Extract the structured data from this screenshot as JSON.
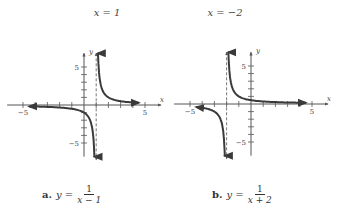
{
  "chart_data": [
    {
      "type": "line",
      "label": "a.",
      "equation": "y = 1/(x - 1)",
      "equation_lhs": "y =",
      "numerator": "1",
      "denominator": "x − 1",
      "asymptote_label": "x = 1",
      "asymptote_x": 1,
      "xlabel": "x",
      "ylabel": "y",
      "xlim": [
        -5,
        5
      ],
      "ylim": [
        -5,
        5
      ],
      "tick_labels": {
        "x_min": "−5",
        "x_max": "5",
        "y_max": "5",
        "y_min": "−5"
      },
      "branches": [
        {
          "x": [
            1.1,
            1.25,
            1.5,
            2,
            3,
            4.5
          ],
          "y": [
            10,
            4,
            2,
            1,
            0.5,
            0.29
          ]
        },
        {
          "x": [
            -4.5,
            -3,
            -2,
            -1,
            0,
            0.5,
            0.8,
            0.9
          ],
          "y": [
            -0.18,
            -0.25,
            -0.33,
            -0.5,
            -1,
            -2,
            -5,
            -10
          ]
        }
      ],
      "grid": false
    },
    {
      "type": "line",
      "label": "b.",
      "equation": "y = 1/(x + 2)",
      "equation_lhs": "y =",
      "numerator": "1",
      "denominator": "x + 2",
      "asymptote_label": "x = −2",
      "asymptote_x": -2,
      "xlabel": "x",
      "ylabel": "y",
      "xlim": [
        -5,
        5
      ],
      "ylim": [
        -5,
        5
      ],
      "tick_labels": {
        "x_min": "−5",
        "x_max": "5",
        "y_max": "5",
        "y_min": "−5"
      },
      "branches": [
        {
          "x": [
            -1.9,
            -1.8,
            -1.5,
            -1,
            0,
            1,
            2,
            4
          ],
          "y": [
            10,
            5,
            2,
            1,
            0.5,
            0.33,
            0.25,
            0.17
          ]
        },
        {
          "x": [
            -4.5,
            -3.5,
            -3,
            -2.5,
            -2.2,
            -2.1
          ],
          "y": [
            -0.4,
            -0.67,
            -1,
            -2,
            -5,
            -10
          ]
        }
      ],
      "grid": false
    }
  ],
  "captions": {
    "a": {
      "letter": "a.",
      "lhs": "y =",
      "num": "1",
      "den": "x − 1"
    },
    "b": {
      "letter": "b.",
      "lhs": "y =",
      "num": "1",
      "den": "x + 2"
    }
  },
  "asymptote_labels": {
    "a": "x = 1",
    "b": "x = −2"
  },
  "colors": {
    "curve": "#3a3a3a",
    "axis": "#555555",
    "asymptote": "#666666"
  }
}
